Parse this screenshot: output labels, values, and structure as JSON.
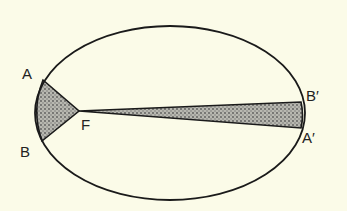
{
  "diagram": {
    "labels": {
      "A": "A",
      "B": "B",
      "F": "F",
      "A_prime": "A′",
      "B_prime": "B′"
    },
    "colors": {
      "background": "#fbfbe8",
      "stroke": "#1a1a1a",
      "shade": "#9a9a9a"
    }
  }
}
